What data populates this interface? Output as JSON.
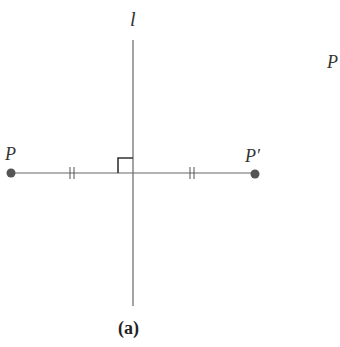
{
  "figure": {
    "caption": "(a)",
    "line_label": "l",
    "point_label": "P",
    "image_label": "P′",
    "offscreen_label": "P",
    "colors": {
      "line": "#555555",
      "point": "#555555",
      "text": "#333333"
    },
    "geometry": {
      "mirror_line": {
        "x": 133,
        "y1": 40,
        "y2": 306
      },
      "segment": {
        "y": 173,
        "x1": 11,
        "x2": 255
      },
      "point_P": {
        "x": 11,
        "y": 173
      },
      "point_P_prime": {
        "x": 255,
        "y": 173
      },
      "right_angle_mark": {
        "x": 118,
        "y": 158,
        "size": 15
      },
      "congruence_ticks": [
        72,
        192
      ]
    }
  }
}
